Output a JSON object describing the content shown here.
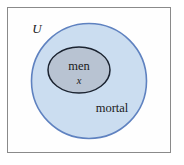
{
  "figure": {
    "type": "euler-diagram",
    "background_color": "#ffffff",
    "frame": {
      "border_color": "#8a8a8a",
      "fill_color": "#fefefe"
    }
  },
  "labels": {
    "universe": "U",
    "subset": "men",
    "element": "x",
    "superset": "mortal"
  },
  "shapes": {
    "outer_circle": {
      "name": "mortal",
      "fill_color": "#cbddf0",
      "stroke_color": "#5f82c0",
      "cx": 89,
      "cy": 81,
      "r": 58
    },
    "inner_ellipse": {
      "name": "men",
      "fill_color": "#b8c3d2",
      "stroke_color": "#1b2330",
      "cx": 79,
      "cy": 70,
      "rx": 31,
      "ry": 23
    }
  },
  "chart_data": {
    "type": "diagram",
    "sets": [
      {
        "label": "U",
        "role": "universe",
        "shape": "rectangle"
      },
      {
        "label": "mortal",
        "role": "superset",
        "shape": "circle"
      },
      {
        "label": "men",
        "role": "subset",
        "shape": "ellipse"
      }
    ],
    "elements": [
      {
        "label": "x",
        "member_of": [
          "men",
          "mortal",
          "U"
        ]
      }
    ],
    "relations": [
      {
        "from": "men",
        "to": "mortal",
        "type": "subset"
      },
      {
        "from": "mortal",
        "to": "U",
        "type": "subset"
      }
    ]
  }
}
